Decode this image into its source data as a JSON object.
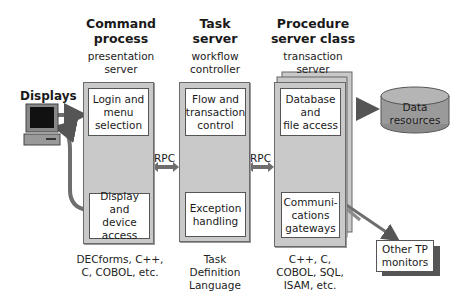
{
  "diagram": {
    "displays": {
      "label": "Displays"
    },
    "command_process": {
      "title_line1": "Command",
      "title_line2": "process",
      "sub_line1": "presentation",
      "sub_line2": "server",
      "box_top": [
        "Login and",
        "menu",
        "selection"
      ],
      "box_bottom": [
        "Display and",
        "device",
        "access"
      ],
      "languages": [
        "DECforms, C++,",
        "C, COBOL, etc."
      ]
    },
    "task_server": {
      "title_line1": "Task",
      "title_line2": "server",
      "sub_line1": "workflow",
      "sub_line2": "controller",
      "box_top": [
        "Flow and",
        "transaction",
        "control"
      ],
      "box_bottom": [
        "Exception",
        "handling"
      ],
      "languages": [
        "Task",
        "Definition",
        "Language"
      ]
    },
    "procedure_server": {
      "title_line1": "Procedure",
      "title_line2": "server class",
      "sub_line1": "transaction",
      "sub_line2": "server",
      "box_top": [
        "Database",
        "and",
        "file access"
      ],
      "box_bottom": [
        "Communi-",
        "cations",
        "gateways"
      ],
      "languages": [
        "C++, C,",
        "COBOL, SQL,",
        "ISAM, etc."
      ]
    },
    "rpc_left": "RPC",
    "rpc_right": "RPC",
    "data_resources": [
      "Data",
      "resources"
    ],
    "other_tp": [
      "Other TP",
      "monitors"
    ]
  },
  "colors": {
    "column_fill": "#c9c9c9",
    "arrow": "#6e6e6e",
    "cylinder": "#9a9a9a"
  }
}
